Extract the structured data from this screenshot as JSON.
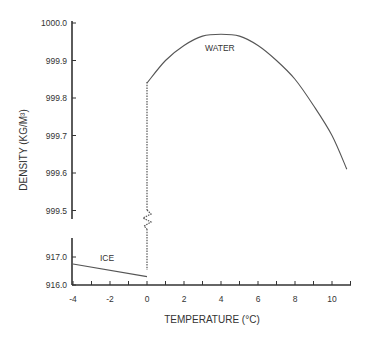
{
  "chart_data": {
    "type": "line",
    "title": "",
    "xlabel": "TEMPERATURE (°C)",
    "ylabel": "DENSITY (KG/M³)",
    "xlim": [
      -4,
      11
    ],
    "x_ticks": [
      "-4",
      "-2",
      "0",
      "2",
      "4",
      "6",
      "8",
      "10"
    ],
    "y_axis_broken": true,
    "y_upper_ticks": [
      "1000.0",
      "999.9",
      "999.8",
      "999.7",
      "999.6",
      "999.5"
    ],
    "y_upper_range": [
      999.48,
      1000.0
    ],
    "y_lower_ticks": [
      "917.0",
      "916.0"
    ],
    "y_lower_range": [
      916.0,
      917.2
    ],
    "grid": false,
    "legend": "none (inline labels)",
    "series": [
      {
        "name": "ICE",
        "axis": "lower",
        "x": [
          -4,
          0
        ],
        "y": [
          916.75,
          916.3
        ]
      },
      {
        "name": "WATER",
        "axis": "upper",
        "x": [
          0,
          1,
          2,
          3,
          4,
          5,
          6,
          7,
          8,
          9,
          10,
          10.8
        ],
        "y": [
          999.84,
          999.9,
          999.94,
          999.965,
          999.97,
          999.965,
          999.94,
          999.9,
          999.85,
          999.78,
          999.7,
          999.61
        ]
      }
    ],
    "annotations": [
      {
        "text": "WATER",
        "x": 4,
        "y": 999.93
      },
      {
        "text": "ICE",
        "x": -2,
        "y": 916.6
      },
      {
        "text": "dashed vertical transition at 0 °C with axis-break zigzag",
        "x": 0
      }
    ]
  }
}
